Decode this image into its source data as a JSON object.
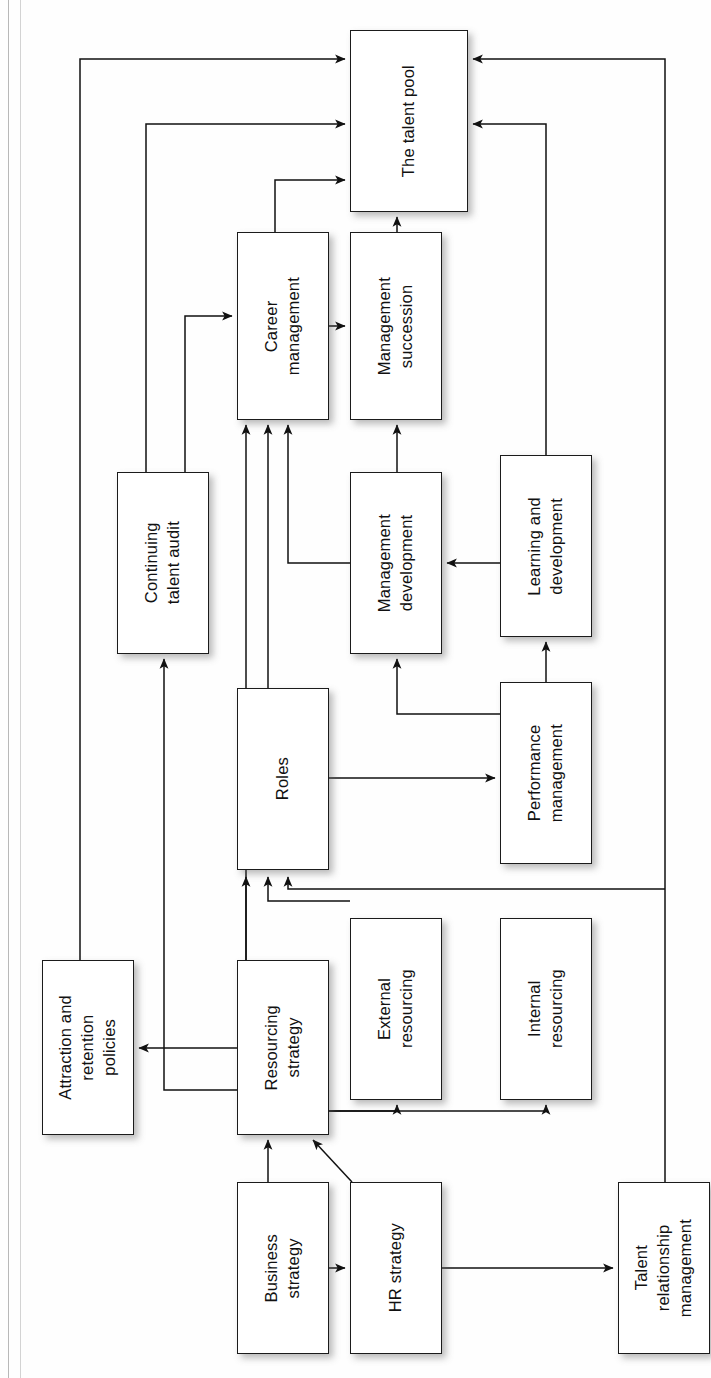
{
  "diagram": {
    "orientation": "rotated-90-ccw",
    "style": {
      "box_fill": "#ffffff",
      "box_stroke": "#1b1b1b",
      "connector_stroke": "#111111",
      "shadow": "rgba(90,90,90,0.42)",
      "page_background": "#ffffff"
    },
    "nodes": [
      {
        "id": "talent-pool",
        "label": "The talent pool",
        "x": 350,
        "y": 30,
        "w": 118,
        "h": 182
      },
      {
        "id": "career-management",
        "label": "Career\nmanagement",
        "x": 237,
        "y": 232,
        "w": 92,
        "h": 188
      },
      {
        "id": "management-succession",
        "label": "Management\nsuccession",
        "x": 350,
        "y": 232,
        "w": 92,
        "h": 188
      },
      {
        "id": "continuing-talent-audit",
        "label": "Continuing\ntalent audit",
        "x": 117,
        "y": 472,
        "w": 92,
        "h": 182
      },
      {
        "id": "management-development",
        "label": "Management\ndevelopment",
        "x": 350,
        "y": 472,
        "w": 92,
        "h": 182
      },
      {
        "id": "learning-development",
        "label": "Learning and\ndevelopment",
        "x": 500,
        "y": 455,
        "w": 92,
        "h": 182
      },
      {
        "id": "roles",
        "label": "Roles",
        "x": 237,
        "y": 688,
        "w": 92,
        "h": 182
      },
      {
        "id": "performance-management",
        "label": "Performance\nmanagement",
        "x": 500,
        "y": 682,
        "w": 92,
        "h": 182
      },
      {
        "id": "attraction-retention",
        "label": "Attraction and\nretention\npolicies",
        "x": 42,
        "y": 960,
        "w": 92,
        "h": 175
      },
      {
        "id": "resourcing-strategy",
        "label": "Resourcing\nstrategy",
        "x": 237,
        "y": 960,
        "w": 92,
        "h": 175
      },
      {
        "id": "external-resourcing",
        "label": "External\nresourcing",
        "x": 350,
        "y": 918,
        "w": 92,
        "h": 182
      },
      {
        "id": "internal-resourcing",
        "label": "Internal\nresourcing",
        "x": 500,
        "y": 918,
        "w": 92,
        "h": 182
      },
      {
        "id": "business-strategy",
        "label": "Business\nstrategy",
        "x": 237,
        "y": 1182,
        "w": 92,
        "h": 172
      },
      {
        "id": "hr-strategy",
        "label": "HR strategy",
        "x": 350,
        "y": 1182,
        "w": 92,
        "h": 172
      },
      {
        "id": "talent-relationship",
        "label": "Talent\nrelationship\nmanagement",
        "x": 618,
        "y": 1182,
        "w": 92,
        "h": 172
      }
    ],
    "edges": [
      {
        "id": "e-attraction-to-pool",
        "from": "attraction-retention",
        "to": "talent-pool"
      },
      {
        "id": "e-continuing-audit-to-pool",
        "from": "continuing-talent-audit",
        "to": "talent-pool"
      },
      {
        "id": "e-career-to-pool",
        "from": "career-management",
        "to": "talent-pool"
      },
      {
        "id": "e-talent-relationship-to-pool",
        "from": "talent-relationship",
        "to": "talent-pool"
      },
      {
        "id": "e-learning-to-pool",
        "from": "learning-development",
        "to": "talent-pool"
      },
      {
        "id": "e-succession-to-pool",
        "from": "management-succession",
        "to": "talent-pool"
      },
      {
        "id": "e-career-to-succession",
        "from": "career-management",
        "to": "management-succession"
      },
      {
        "id": "e-continuing-audit-to-career",
        "from": "continuing-talent-audit",
        "to": "career-management"
      },
      {
        "id": "e-mgmt-dev-to-career",
        "from": "management-development",
        "to": "career-management"
      },
      {
        "id": "e-roles-to-career",
        "from": "roles",
        "to": "career-management"
      },
      {
        "id": "e-resourcing-to-career",
        "from": "resourcing-strategy",
        "to": "career-management"
      },
      {
        "id": "e-mgmt-dev-to-succession",
        "from": "management-development",
        "to": "management-succession"
      },
      {
        "id": "e-learning-to-mgmt-dev",
        "from": "learning-development",
        "to": "management-development"
      },
      {
        "id": "e-performance-to-mgmt-dev",
        "from": "performance-management",
        "to": "management-development"
      },
      {
        "id": "e-performance-to-learning",
        "from": "performance-management",
        "to": "learning-development"
      },
      {
        "id": "e-roles-to-performance",
        "from": "roles",
        "to": "performance-management"
      },
      {
        "id": "e-resourcing-to-roles",
        "from": "resourcing-strategy",
        "to": "roles"
      },
      {
        "id": "e-external-to-roles",
        "from": "external-resourcing",
        "to": "roles"
      },
      {
        "id": "e-internal-to-roles",
        "from": "internal-resourcing",
        "to": "roles"
      },
      {
        "id": "e-resourcing-to-attraction",
        "from": "resourcing-strategy",
        "to": "attraction-retention"
      },
      {
        "id": "e-resourcing-to-audit",
        "from": "resourcing-strategy",
        "to": "continuing-talent-audit"
      },
      {
        "id": "e-resourcing-to-external",
        "from": "resourcing-strategy",
        "to": "external-resourcing"
      },
      {
        "id": "e-resourcing-to-internal",
        "from": "resourcing-strategy",
        "to": "internal-resourcing"
      },
      {
        "id": "e-business-to-resourcing",
        "from": "business-strategy",
        "to": "resourcing-strategy"
      },
      {
        "id": "e-hr-to-resourcing",
        "from": "hr-strategy",
        "to": "resourcing-strategy"
      },
      {
        "id": "e-business-to-hr",
        "from": "business-strategy",
        "to": "hr-strategy"
      },
      {
        "id": "e-hr-to-talent-relationship",
        "from": "hr-strategy",
        "to": "talent-relationship"
      }
    ]
  }
}
